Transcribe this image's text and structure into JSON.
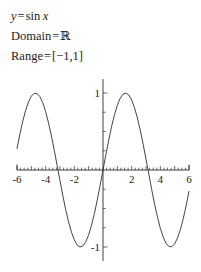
{
  "statement": {
    "equation": {
      "lhs": "y",
      "eq": "=",
      "fn": "sin",
      "arg": "x"
    },
    "domain": {
      "label": "Domain",
      "eq": "=",
      "value": "ℝ"
    },
    "range": {
      "label": "Range",
      "eq": "=",
      "value": "[−1,1]"
    }
  },
  "chart_data": {
    "type": "line",
    "title": "",
    "subtitle": "",
    "xlabel": "",
    "ylabel": "",
    "function": "y = sin x",
    "xlim": [
      -6.0,
      6.0
    ],
    "ylim": [
      -1.18,
      1.18
    ],
    "grid": false,
    "legend": null,
    "axis_style": "centered-cross",
    "xticks": [
      -6,
      -5,
      -4,
      -3,
      -2,
      -1,
      1,
      2,
      3,
      4,
      5,
      6
    ],
    "xtick_labels": [
      "-6",
      "",
      "-4",
      "",
      "-2",
      "",
      "",
      "2",
      "",
      "4",
      "",
      "6"
    ],
    "xtick_labeled_values": [
      -6,
      -4,
      -2,
      2,
      4,
      6
    ],
    "xminor_step": 0.25,
    "yticks": [
      -1,
      -0.75,
      -0.5,
      -0.25,
      0.25,
      0.5,
      0.75,
      1
    ],
    "ytick_labels": [
      "-1",
      "",
      "",
      "",
      "",
      "",
      "",
      "1"
    ],
    "ytick_labeled_values": [
      -1,
      1
    ],
    "series": [
      {
        "name": "sin x",
        "color": "#3a3a3a",
        "x": [
          -6.0,
          -5.8,
          -5.6,
          -5.4,
          -5.2,
          -5.0,
          -4.8,
          -4.6,
          -4.4,
          -4.2,
          -4.0,
          -3.8,
          -3.6,
          -3.4,
          -3.2,
          -3.0,
          -2.8,
          -2.6,
          -2.4,
          -2.2,
          -2.0,
          -1.8,
          -1.6,
          -1.4,
          -1.2,
          -1.0,
          -0.8,
          -0.6,
          -0.4,
          -0.2,
          0.0,
          0.2,
          0.4,
          0.6,
          0.8,
          1.0,
          1.2,
          1.4,
          1.6,
          1.8,
          2.0,
          2.2,
          2.4,
          2.6,
          2.8,
          3.0,
          3.2,
          3.4,
          3.6,
          3.8,
          4.0,
          4.2,
          4.4,
          4.6,
          4.8,
          5.0,
          5.2,
          5.4,
          5.6,
          5.8,
          6.0
        ],
        "y": [
          0.279,
          0.465,
          0.631,
          0.773,
          0.883,
          0.959,
          0.996,
          0.994,
          0.952,
          0.872,
          0.757,
          0.612,
          0.443,
          0.256,
          0.058,
          -0.141,
          -0.335,
          -0.516,
          -0.675,
          -0.808,
          -0.909,
          -0.974,
          -1.0,
          -0.985,
          -0.932,
          -0.841,
          -0.717,
          -0.565,
          -0.389,
          -0.199,
          0.0,
          0.199,
          0.389,
          0.565,
          0.717,
          0.841,
          0.932,
          0.985,
          1.0,
          0.974,
          0.909,
          0.808,
          0.675,
          0.516,
          0.335,
          0.141,
          -0.058,
          -0.256,
          -0.443,
          -0.612,
          -0.757,
          -0.872,
          -0.952,
          -0.994,
          -0.996,
          -0.959,
          -0.883,
          -0.773,
          -0.631,
          -0.465,
          -0.279
        ],
        "maxima_x": [
          -4.712,
          1.571
        ],
        "minima_x": [
          -1.571,
          4.712
        ],
        "zeros_x": [
          -3.142,
          0.0,
          3.142
        ],
        "amplitude": 1,
        "period": 6.283
      }
    ]
  },
  "colors": {
    "axis": "#2b2b2b",
    "curve": "#3a3a3a",
    "text": "#1c1c1c",
    "background": "#ffffff"
  }
}
